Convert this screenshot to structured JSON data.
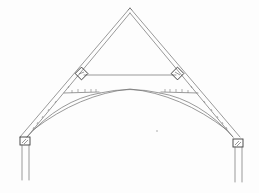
{
  "drawing": {
    "title": "Arch-braced roof truss sketch",
    "style": "pencil line drawing",
    "colors": {
      "background": "#fdfdfd",
      "line": "#6e6e6e",
      "dark_line": "#3a3a3a"
    },
    "elements": [
      "ridge-apex",
      "left-principal-rafter",
      "right-principal-rafter",
      "collar-tie",
      "left-purlin-block",
      "right-purlin-block",
      "arch-brace",
      "left-wall-plate",
      "right-wall-plate",
      "left-wall-post",
      "right-wall-post"
    ]
  }
}
